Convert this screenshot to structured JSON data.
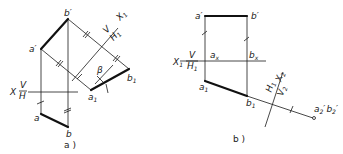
{
  "diagram_a": {
    "caption": "a )",
    "points": {
      "b_prime": "b′",
      "a_prime": "a′",
      "a": "a",
      "b": "b",
      "a1": "a",
      "a1_sub": "1",
      "b1": "b",
      "b1_sub": "1"
    },
    "axis_x": {
      "x": "X",
      "top": "V",
      "bottom": "H"
    },
    "axis_x1": {
      "top": "V",
      "x": "X",
      "x_sub": "1",
      "bottom": "H",
      "bottom_sub": "1"
    },
    "angle": "β"
  },
  "diagram_b": {
    "caption": "b )",
    "points": {
      "a_prime": "a′",
      "b_prime": "b′",
      "ax": "a",
      "ax_sub": "x",
      "bx": "b",
      "bx_sub": "x",
      "a1": "a",
      "a1_sub": "1",
      "b1": "b",
      "b1_sub": "1",
      "a2b2": "a",
      "a2_sub": "2",
      "a2_prime": "′",
      "b2": "b",
      "b2_sub": "2",
      "b2_prime": "′"
    },
    "axis_x1": {
      "x": "X",
      "x_sub": "1",
      "top": "V",
      "bottom": "H",
      "bottom_sub": "1"
    },
    "axis_x2": {
      "top": "H",
      "top_sub": "1",
      "x": "X",
      "x_sub": "2",
      "bottom": "V",
      "bottom_sub": "2"
    }
  }
}
